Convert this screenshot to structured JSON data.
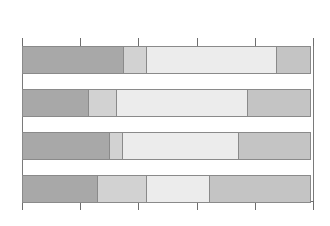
{
  "chart_data": {
    "type": "bar",
    "orientation": "horizontal",
    "stacked": true,
    "normalized_percent": true,
    "title": "",
    "subtitle": "",
    "xlabel": "",
    "ylabel": "",
    "xlim": [
      0,
      100
    ],
    "grid": false,
    "legend": "none",
    "axis_ticks_top": true,
    "axis_ticks_bottom": true,
    "tick_values": [
      0,
      20,
      40,
      60,
      80,
      100
    ],
    "tick_labels": [
      "",
      "",
      "",
      "",
      "",
      ""
    ],
    "categories": [
      "Bar 1",
      "Bar 2",
      "Bar 3",
      "Bar 4"
    ],
    "category_labels_visible": false,
    "series": [
      {
        "name": "Series 1",
        "color": "#a8a8a8",
        "values": [
          35,
          23,
          30,
          26
        ]
      },
      {
        "name": "Series 2",
        "color": "#d2d2d2",
        "values": [
          8,
          10,
          5,
          17
        ]
      },
      {
        "name": "Series 3",
        "color": "#ececec",
        "values": [
          45,
          45,
          40,
          22
        ]
      },
      {
        "name": "Series 4",
        "color": "#c4c4c4",
        "values": [
          12,
          22,
          25,
          35
        ]
      }
    ]
  },
  "style": {
    "background": "#ffffff",
    "axis_color": "#6e6e6e",
    "segment_border": "#8a8a8a",
    "bar_height_px": 28,
    "bar_gap_px": 15
  }
}
